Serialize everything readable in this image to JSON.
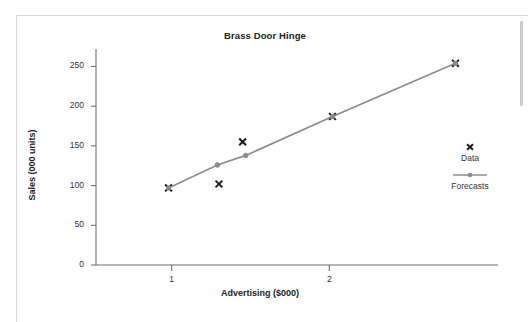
{
  "chart_data": {
    "type": "scatter",
    "title": "Brass Door Hinge",
    "xlabel": "Advertising ($000)",
    "ylabel": "Sales (000 units)",
    "xlim": [
      0.52,
      3.07
    ],
    "ylim": [
      0,
      272
    ],
    "xticks": [
      1,
      2
    ],
    "xticklabels": [
      "1",
      "2"
    ],
    "yticks": [
      0,
      50,
      100,
      150,
      200,
      250
    ],
    "yticklabels": [
      "0",
      "50",
      "100",
      "150",
      "200",
      "250"
    ],
    "grid": false,
    "legend_position": "right",
    "series": [
      {
        "name": "Data",
        "marker": "x",
        "color": "#1a1a1a",
        "line": false,
        "points": [
          {
            "x": 0.98,
            "y": 97
          },
          {
            "x": 1.3,
            "y": 102
          },
          {
            "x": 1.45,
            "y": 155
          },
          {
            "x": 2.02,
            "y": 187
          },
          {
            "x": 2.8,
            "y": 254
          }
        ]
      },
      {
        "name": "Forecasts",
        "marker": "circle",
        "color": "#8c8c8c",
        "line": true,
        "points": [
          {
            "x": 0.98,
            "y": 97
          },
          {
            "x": 1.29,
            "y": 126
          },
          {
            "x": 1.47,
            "y": 138
          },
          {
            "x": 2.02,
            "y": 187
          },
          {
            "x": 2.8,
            "y": 254
          }
        ]
      }
    ]
  },
  "legend": {
    "entries": [
      {
        "label": "Data",
        "marker": "x-marker-icon"
      },
      {
        "label": "Forecasts",
        "marker": "line-circle-marker-icon"
      }
    ]
  },
  "colors": {
    "axis": "#6e6e6e",
    "data_marker": "#1a1a1a",
    "forecast_line": "#8c8c8c",
    "text": "#222222",
    "frame": "#d8d8d8",
    "scrollbar": "#cccccc"
  }
}
